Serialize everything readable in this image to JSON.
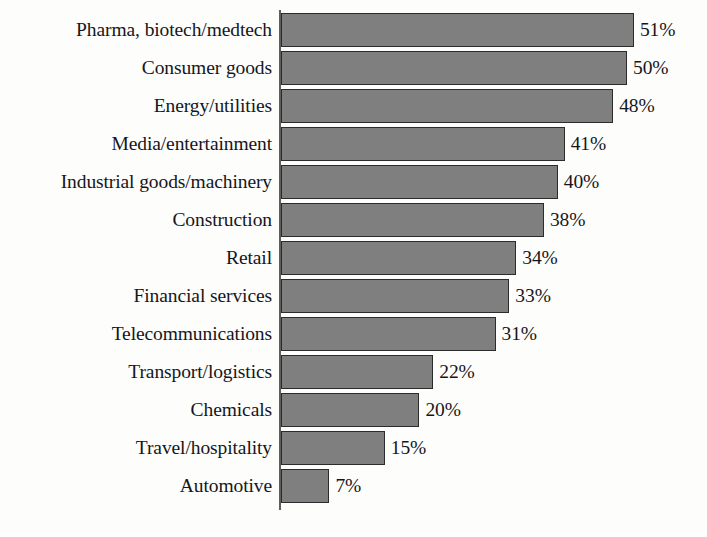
{
  "chart_data": {
    "type": "bar",
    "orientation": "horizontal",
    "title": "",
    "subtitle": "",
    "xlabel": "",
    "ylabel": "",
    "xlim": [
      0,
      51
    ],
    "grid": false,
    "legend": null,
    "value_suffix": "%",
    "categories": [
      "Pharma, biotech/medtech",
      "Consumer goods",
      "Energy/utilities",
      "Media/entertainment",
      "Industrial goods/machinery",
      "Construction",
      "Retail",
      "Financial services",
      "Telecommunications",
      "Transport/logistics",
      "Chemicals",
      "Travel/hospitality",
      "Automotive"
    ],
    "values": [
      51,
      50,
      48,
      41,
      40,
      38,
      34,
      33,
      31,
      22,
      20,
      15,
      7
    ],
    "value_labels": [
      "51%",
      "50%",
      "48%",
      "41%",
      "40%",
      "38%",
      "34%",
      "33%",
      "31%",
      "22%",
      "20%",
      "15%",
      "7%"
    ],
    "bars": [
      {
        "category": "Pharma, biotech/medtech",
        "value": 51,
        "label": "51%"
      },
      {
        "category": "Consumer goods",
        "value": 50,
        "label": "50%"
      },
      {
        "category": "Energy/utilities",
        "value": 48,
        "label": "48%"
      },
      {
        "category": "Media/entertainment",
        "value": 41,
        "label": "41%"
      },
      {
        "category": "Industrial goods/machinery",
        "value": 40,
        "label": "40%"
      },
      {
        "category": "Construction",
        "value": 38,
        "label": "38%"
      },
      {
        "category": "Retail",
        "value": 34,
        "label": "34%"
      },
      {
        "category": "Financial services",
        "value": 33,
        "label": "33%"
      },
      {
        "category": "Telecommunications",
        "value": 31,
        "label": "31%"
      },
      {
        "category": "Transport/logistics",
        "value": 22,
        "label": "22%"
      },
      {
        "category": "Chemicals",
        "value": 20,
        "label": "20%"
      },
      {
        "category": "Travel/hospitality",
        "value": 15,
        "label": "15%"
      },
      {
        "category": "Automotive",
        "value": 7,
        "label": "7%"
      }
    ],
    "colors": {
      "bar_fill": "#7f7f7f",
      "bar_border": "#2b2b2b",
      "axis": "#5d5d5d",
      "text": "#16161a",
      "background": "#fdfdfc"
    }
  }
}
